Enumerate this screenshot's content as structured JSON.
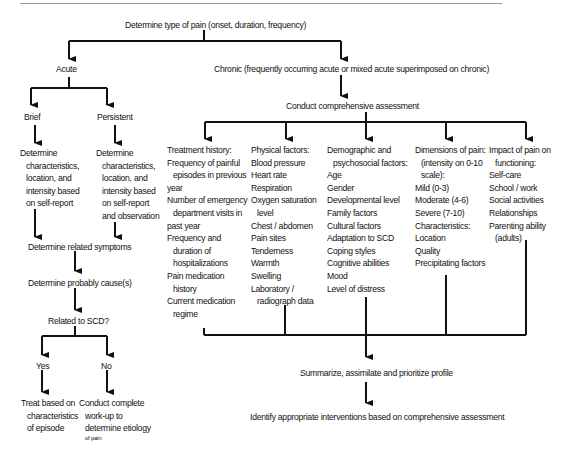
{
  "diagram": {
    "root": "Determine type of pain (onset, duration, frequency)",
    "acute": {
      "label": "Acute",
      "brief": {
        "label": "Brief",
        "step": [
          "Determine",
          "characteristics,",
          "location, and",
          "intensity based",
          "on self-report"
        ]
      },
      "persistent": {
        "label": "Persistent",
        "step": [
          "Determine",
          "characteristics,",
          "location, and",
          "intensity based",
          "on self-report",
          "and observation"
        ]
      },
      "related_symptoms": "Determine related symptoms",
      "probable_cause": "Determine probably cause(s)",
      "question": "Related to SCD?",
      "yes": {
        "label": "Yes",
        "action": [
          "Treat based on",
          "characteristics",
          "of episode"
        ]
      },
      "no": {
        "label": "No",
        "action": [
          "Conduct complete",
          "work-up  to",
          "determine etiology"
        ],
        "action_tail": "of pain"
      }
    },
    "chronic": {
      "label": "Chronic (frequently occurring acute or mixed acute superimposed on chronic)",
      "assessment": "Conduct comprehensive assessment",
      "categories": [
        {
          "name": "treatment-history",
          "lines": [
            {
              "t": "Treatment history:",
              "i": false
            },
            {
              "t": "Frequency of painful",
              "i": false
            },
            {
              "t": "episodes in previous",
              "i": true
            },
            {
              "t": "year",
              "i": false
            },
            {
              "t": "Number of emergency",
              "i": false
            },
            {
              "t": "department visits in",
              "i": true
            },
            {
              "t": "past year",
              "i": false
            },
            {
              "t": "Frequency and",
              "i": false
            },
            {
              "t": "duration of",
              "i": true
            },
            {
              "t": "hospitalizations",
              "i": true
            },
            {
              "t": "Pain medication",
              "i": false
            },
            {
              "t": "history",
              "i": true
            },
            {
              "t": "Current medication",
              "i": false
            },
            {
              "t": "regime",
              "i": true
            }
          ]
        },
        {
          "name": "physical-factors",
          "lines": [
            {
              "t": "Physical factors:",
              "i": false
            },
            {
              "t": "Blood pressure",
              "i": false
            },
            {
              "t": "Heart rate",
              "i": false
            },
            {
              "t": "Respiration",
              "i": false
            },
            {
              "t": "Oxygen saturation",
              "i": false
            },
            {
              "t": "level",
              "i": true
            },
            {
              "t": "Chest / abdomen",
              "i": false
            },
            {
              "t": "Pain sites",
              "i": false
            },
            {
              "t": "Tenderness",
              "i": false
            },
            {
              "t": "Warmth",
              "i": false
            },
            {
              "t": "Swelling",
              "i": false
            },
            {
              "t": "Laboratory /",
              "i": false
            },
            {
              "t": "radiograph data",
              "i": true
            }
          ]
        },
        {
          "name": "demographic-psychosocial-factors",
          "lines": [
            {
              "t": "Demographic and",
              "i": false
            },
            {
              "t": "psychosocial factors:",
              "i": true
            },
            {
              "t": "Age",
              "i": false
            },
            {
              "t": "Gender",
              "i": false
            },
            {
              "t": "Developmental level",
              "i": false
            },
            {
              "t": "Family factors",
              "i": false
            },
            {
              "t": "Cultural factors",
              "i": false
            },
            {
              "t": "Adaptation to SCD",
              "i": false
            },
            {
              "t": "Coping styles",
              "i": false
            },
            {
              "t": "Cognitive abilities",
              "i": false
            },
            {
              "t": "Mood",
              "i": false
            },
            {
              "t": "Level of distress",
              "i": false
            }
          ]
        },
        {
          "name": "dimensions-of-pain",
          "lines": [
            {
              "t": "Dimensions of pain:",
              "i": false
            },
            {
              "t": "(intensity on 0-10",
              "i": true
            },
            {
              "t": "scale):",
              "i": true
            },
            {
              "t": "Mild (0-3)",
              "i": false
            },
            {
              "t": "Moderate (4-6)",
              "i": false
            },
            {
              "t": "Severe (7-10)",
              "i": false
            },
            {
              "t": "Characteristics:",
              "i": false
            },
            {
              "t": "Location",
              "i": false
            },
            {
              "t": "Quality",
              "i": false
            },
            {
              "t": "Precipitating factors",
              "i": false
            }
          ]
        },
        {
          "name": "impact-on-functioning",
          "lines": [
            {
              "t": "Impact of pain on",
              "i": false
            },
            {
              "t": "functioning:",
              "i": true
            },
            {
              "t": "Self-care",
              "i": false
            },
            {
              "t": "School / work",
              "i": false
            },
            {
              "t": "Social activities",
              "i": false
            },
            {
              "t": "Relationships",
              "i": false
            },
            {
              "t": "Parenting ability",
              "i": false
            },
            {
              "t": "(adults)",
              "i": true
            }
          ]
        }
      ],
      "summarize": "Summarize, assimilate and prioritize profile",
      "interventions": "Identify appropriate interventions based on comprehensive assessment"
    },
    "colors": {
      "line": "#111111",
      "text": "#111111",
      "rule": "#9a9a9a"
    }
  }
}
